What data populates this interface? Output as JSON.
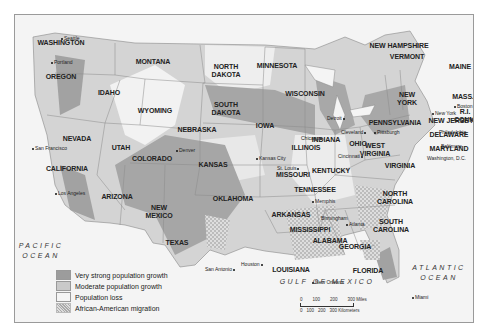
{
  "legend": {
    "items": [
      {
        "label": "Very strong population growth",
        "color": "#9c9c9c",
        "pattern": "solid"
      },
      {
        "label": "Moderate population growth",
        "color": "#c9c9c9",
        "pattern": "solid"
      },
      {
        "label": "Population loss",
        "color": "#f2f2f2",
        "pattern": "solid"
      },
      {
        "label": "African-American migration",
        "color": "#d6d6d6",
        "pattern": "crosshatch"
      }
    ]
  },
  "oceans": {
    "pacific": "PACIFIC\nOCEAN",
    "pacific_line1": "PACIFIC",
    "pacific_line2": "OCEAN",
    "atlantic_line1": "ATLANTIC",
    "atlantic_line2": "OCEAN",
    "gulf": "GULF OF MEXICO"
  },
  "scale": {
    "miles": [
      "0",
      "100",
      "200",
      "300 Miles"
    ],
    "km": [
      "0",
      "100",
      "200",
      "300 Kilometers"
    ]
  },
  "states": {
    "washington": "WASHINGTON",
    "oregon": "OREGON",
    "california": "CALIFORNIA",
    "nevada": "NEVADA",
    "idaho": "IDAHO",
    "montana": "MONTANA",
    "wyoming": "WYOMING",
    "utah": "UTAH",
    "arizona": "ARIZONA",
    "colorado": "COLORADO",
    "new_mexico_1": "NEW",
    "new_mexico_2": "MEXICO",
    "north_dakota_1": "NORTH",
    "north_dakota_2": "DAKOTA",
    "south_dakota_1": "SOUTH",
    "south_dakota_2": "DAKOTA",
    "nebraska": "NEBRASKA",
    "kansas": "KANSAS",
    "oklahoma": "OKLAHOMA",
    "texas": "TEXAS",
    "minnesota": "MINNESOTA",
    "iowa": "IOWA",
    "missouri": "MISSOURI",
    "arkansas": "ARKANSAS",
    "louisiana": "LOUISIANA",
    "wisconsin": "WISCONSIN",
    "illinois": "ILLINOIS",
    "indiana": "INDIANA",
    "ohio": "OHIO",
    "kentucky": "KENTUCKY",
    "tennessee": "TENNESSEE",
    "mississippi": "MISSISSIPPI",
    "alabama": "ALABAMA",
    "georgia": "GEORGIA",
    "florida": "FLORIDA",
    "south_carolina_1": "SOUTH",
    "south_carolina_2": "CAROLINA",
    "north_carolina_1": "NORTH",
    "north_carolina_2": "CAROLINA",
    "virginia": "VIRGINIA",
    "west_virginia_1": "WEST",
    "west_virginia_2": "VIRGINIA",
    "pennsylvania": "PENNSYLVANIA",
    "new_york_1": "NEW",
    "new_york_2": "YORK",
    "new_jersey": "NEW JERSEY",
    "delaware": "DELAWARE",
    "maryland": "MARYLAND",
    "new_hampshire": "NEW HAMPSHIRE",
    "vermont": "VERMONT",
    "maine": "MAINE",
    "mass": "MASS.",
    "ri": "R.I.",
    "conn": "CONN."
  },
  "cities": {
    "seattle": "Seattle",
    "portland": "Portland",
    "san_francisco": "San Francisco",
    "los_angeles": "Los Angeles",
    "denver": "Denver",
    "kansas_city": "Kansas City",
    "st_louis": "St. Louis",
    "chicago": "Chicago",
    "detroit": "Detroit",
    "cleveland": "Cleveland",
    "pittsburgh": "Pittsburgh",
    "cincinnati": "Cincinnati",
    "memphis": "Memphis",
    "birmingham": "Birmingham",
    "atlanta": "Atlanta",
    "new_orleans": "New Orleans",
    "houston": "Houston",
    "san_antonio": "San Antonio",
    "miami": "Miami",
    "new_york": "New York",
    "philadelphia": "Philadelphia",
    "baltimore": "Baltimore",
    "washington_dc": "Washington, D.C.",
    "boston": "Boston"
  }
}
